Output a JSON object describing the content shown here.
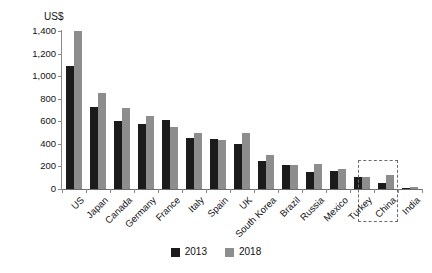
{
  "chart_data": {
    "type": "bar",
    "title": "",
    "subtitle": "",
    "xlabel": "",
    "ylabel": "US$",
    "unit_label": "US$",
    "ylim": [
      0,
      1400
    ],
    "grid": false,
    "legend_position": "bottom-center",
    "categories": [
      "US",
      "Japan",
      "Canada",
      "Germany",
      "France",
      "Italy",
      "Spain",
      "UK",
      "South Korea",
      "Brazil",
      "Russia",
      "Mexico",
      "Turkey",
      "China",
      "India"
    ],
    "ytick_labels": [
      "1,400",
      "1,200",
      "1,000",
      "800",
      "600",
      "400",
      "200",
      "0"
    ],
    "ytick_values": [
      1400,
      1200,
      1000,
      800,
      600,
      400,
      200,
      0
    ],
    "series": [
      {
        "name": "2013",
        "color": "#1b1b1b",
        "values": [
          1090,
          725,
          600,
          575,
          610,
          450,
          440,
          400,
          245,
          210,
          150,
          160,
          105,
          50,
          10
        ]
      },
      {
        "name": "2018",
        "color": "#8d8d8d",
        "values": [
          1400,
          855,
          720,
          650,
          550,
          500,
          430,
          500,
          300,
          210,
          220,
          175,
          110,
          120,
          15
        ]
      }
    ],
    "annotations": [
      {
        "type": "dashed-rectangle",
        "target_category": "China",
        "style": "dashed",
        "color": "#6d6d6d"
      }
    ]
  },
  "legend": {
    "items": [
      {
        "label": "2013",
        "color": "#1b1b1b"
      },
      {
        "label": "2018",
        "color": "#8d8d8d"
      }
    ]
  }
}
